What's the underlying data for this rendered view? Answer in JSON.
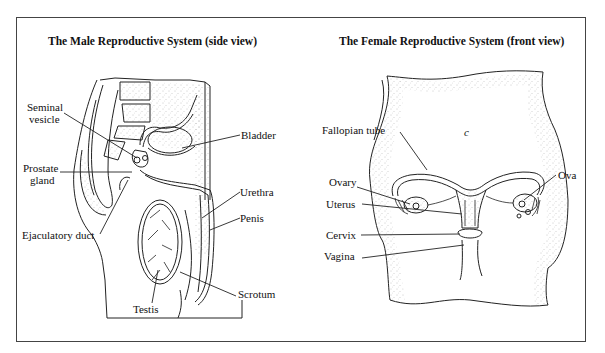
{
  "male": {
    "title": "The Male Reproductive System (side view)",
    "labels": {
      "seminal_vesicle_1": "Seminal",
      "seminal_vesicle_2": "vesicle",
      "prostate_gland_1": "Prostate",
      "prostate_gland_2": "gland",
      "ejaculatory_duct": "Ejaculatory duct",
      "bladder": "Bladder",
      "urethra": "Urethra",
      "penis": "Penis",
      "testis": "Testis",
      "scrotum": "Scrotum"
    }
  },
  "female": {
    "title": "The Female Reproductive System (front view)",
    "labels": {
      "fallopian_tube": "Fallopian tube",
      "ovary": "Ovary",
      "uterus": "Uterus",
      "cervix": "Cervix",
      "vagina": "Vagina",
      "ova": "Ova",
      "navel": "c"
    }
  },
  "colors": {
    "line": "#222222",
    "frame": "#444444",
    "stipple": "#9a9a9a",
    "background": "#ffffff"
  }
}
